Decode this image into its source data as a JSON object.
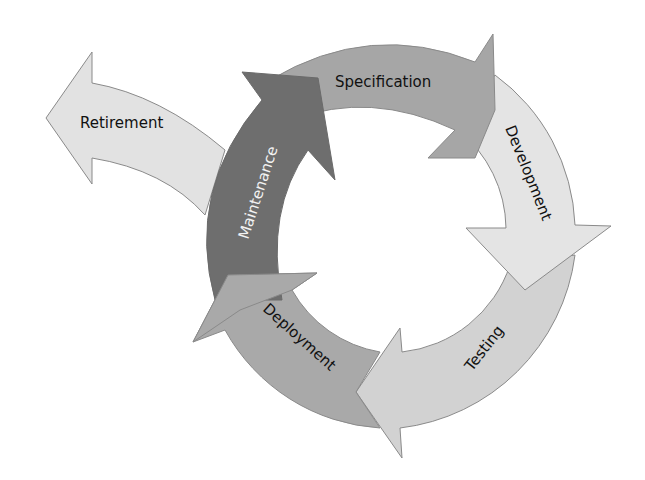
{
  "diagram": {
    "type": "cycle",
    "title": "",
    "stages": [
      {
        "label": "Specification",
        "fill": "#a6a6a6",
        "text_color": "#111111"
      },
      {
        "label": "Development",
        "fill": "#e4e4e4",
        "text_color": "#111111"
      },
      {
        "label": "Testing",
        "fill": "#d2d2d2",
        "text_color": "#111111"
      },
      {
        "label": "Deployment",
        "fill": "#a9a9a9",
        "text_color": "#111111"
      },
      {
        "label": "Maintenance",
        "fill": "#6e6e6e",
        "text_color": "#f2f2f2"
      }
    ],
    "exit": {
      "label": "Retirement",
      "fill": "#e2e2e2",
      "text_color": "#111111"
    },
    "stroke": "#8a8a8a"
  }
}
